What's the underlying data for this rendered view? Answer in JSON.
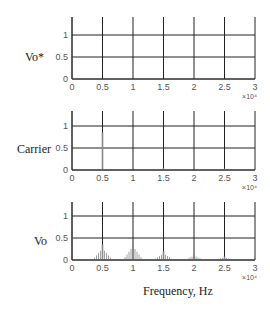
{
  "figure": {
    "xlabel": "Frequency, Hz",
    "x_multiplier": "×10⁴",
    "colors": {
      "axis": "#333333",
      "grid": "#222222",
      "spectrum": "#888888",
      "text": "#555555"
    }
  },
  "chart_data": [
    {
      "type": "bar",
      "title": "",
      "ylabel": "Vo*",
      "xlabel": "",
      "x_multiplier": "×10^4",
      "xlim": [
        0,
        3
      ],
      "ylim": [
        0,
        1.4
      ],
      "xticks": [
        "0",
        "0.5",
        "1",
        "1.5",
        "2",
        "2.5",
        "3"
      ],
      "yticks": [
        "0",
        "0.5",
        "1"
      ],
      "grid": true,
      "x": [
        0
      ],
      "values": [
        0.5
      ]
    },
    {
      "type": "bar",
      "title": "",
      "ylabel": "Carrier",
      "xlabel": "",
      "x_multiplier": "×10^4",
      "xlim": [
        0,
        3
      ],
      "ylim": [
        0,
        1.4
      ],
      "xticks": [
        "0",
        "0.5",
        "1",
        "1.5",
        "2",
        "2.5",
        "3"
      ],
      "yticks": [
        "0",
        "0.5",
        "1"
      ],
      "grid": true,
      "x": [
        0.5,
        1.5,
        2.5
      ],
      "values": [
        0.85,
        0.05,
        0.03
      ]
    },
    {
      "type": "bar",
      "title": "",
      "ylabel": "Vo",
      "xlabel": "Frequency, Hz",
      "x_multiplier": "×10^4",
      "xlim": [
        0,
        3
      ],
      "ylim": [
        0,
        1.4
      ],
      "xticks": [
        "0",
        "0.5",
        "1",
        "1.5",
        "2",
        "2.5",
        "3"
      ],
      "yticks": [
        "0",
        "0.5",
        "1"
      ],
      "grid": true,
      "x": [
        0,
        0.5,
        1.0,
        1.5,
        2.0,
        2.5,
        3.0
      ],
      "values": [
        0.95,
        0.35,
        0.42,
        0.2,
        0.13,
        0.08,
        0.05
      ]
    }
  ]
}
